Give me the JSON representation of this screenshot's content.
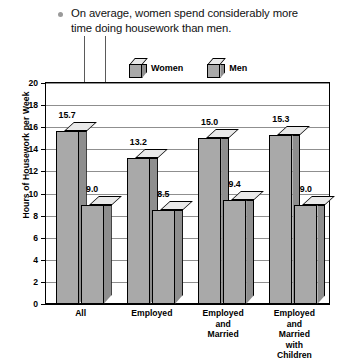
{
  "caption": {
    "bullet_icon": "bullet-dot-icon",
    "text": "On average, women spend considerably more time doing housework than men."
  },
  "legend": {
    "position": "top-inside",
    "items": [
      {
        "label": "Women",
        "icon": "cube-icon"
      },
      {
        "label": "Men",
        "icon": "cube-icon"
      }
    ]
  },
  "chart_data": {
    "type": "bar",
    "title": "",
    "subtitle": "",
    "xlabel": "",
    "ylabel": "Hours of Housework per Week",
    "ylim": [
      0,
      20
    ],
    "ytick_step": 2,
    "yticks": [
      "20",
      "18",
      "16",
      "14",
      "12",
      "10",
      "8",
      "6",
      "4",
      "2",
      "0"
    ],
    "grid": true,
    "legend_position": "top-inside",
    "categories": [
      "All",
      "Employed",
      "Employed and Married",
      "Employed and Married with Children"
    ],
    "category_lines": [
      [
        "All"
      ],
      [
        "Employed"
      ],
      [
        "Employed",
        "and",
        "Married"
      ],
      [
        "Employed",
        "and",
        "Married",
        "with",
        "Children"
      ]
    ],
    "series": [
      {
        "name": "Women",
        "values": [
          15.7,
          13.2,
          15.0,
          15.3
        ],
        "labels": [
          "15.7",
          "13.2",
          "15.0",
          "15.3"
        ],
        "color": "#a9a9a9"
      },
      {
        "name": "Men",
        "values": [
          9.0,
          8.5,
          9.4,
          9.0
        ],
        "labels": [
          "9.0",
          "8.5",
          "9.4",
          "9.0"
        ],
        "color": "#a9a9a9"
      }
    ]
  }
}
